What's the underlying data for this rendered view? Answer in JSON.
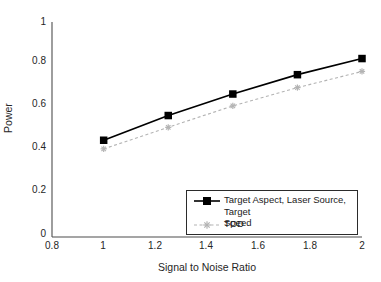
{
  "chart_data": {
    "type": "line",
    "title": "",
    "xlabel": "Signal to Noise Ratio",
    "ylabel": "Power",
    "xlim": [
      0.8,
      2.0
    ],
    "ylim": [
      0,
      1
    ],
    "xticks": [
      "0.8",
      "1",
      "1.2",
      "1.4",
      "1.6",
      "1.8",
      "2"
    ],
    "xtick_values": [
      0.8,
      1.0,
      1.2,
      1.4,
      1.6,
      1.8,
      2.0
    ],
    "yticks": [
      "0",
      "0.2",
      "0.4",
      "0.6",
      "0.8",
      "1"
    ],
    "ytick_values": [
      0,
      0.2,
      0.4,
      0.6,
      0.8,
      1.0
    ],
    "grid": false,
    "legend_position": "lower right",
    "x": [
      1.0,
      1.25,
      1.5,
      1.75,
      2.0
    ],
    "series": [
      {
        "name": "Target Aspect, Laser Source, Target Speed",
        "values": [
          0.45,
          0.565,
          0.665,
          0.755,
          0.83
        ],
        "color": "#000000",
        "linestyle": "solid",
        "marker": "square"
      },
      {
        "name": "TOD",
        "values": [
          0.41,
          0.51,
          0.61,
          0.695,
          0.77
        ],
        "color": "#b3b3b3",
        "linestyle": "dashed",
        "marker": "star"
      }
    ]
  },
  "legend": {
    "entries": [
      {
        "label": "Target Aspect, Laser Source, Target\nSpeed"
      },
      {
        "label": "TOD"
      }
    ]
  },
  "colors": {
    "axis": "#4d4d4d",
    "series_primary": "#000000",
    "series_secondary": "#b3b3b3",
    "text": "#262626",
    "background": "#ffffff"
  }
}
